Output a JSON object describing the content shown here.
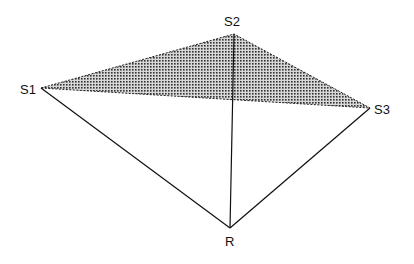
{
  "diagram": {
    "type": "geometry",
    "nodes": [
      {
        "id": "S1",
        "label": "S1",
        "x": 41,
        "y": 88,
        "label_x": 20,
        "label_y": 94
      },
      {
        "id": "S2",
        "label": "S2",
        "x": 234,
        "y": 34,
        "label_x": 224,
        "label_y": 26
      },
      {
        "id": "S3",
        "label": "S3",
        "x": 370,
        "y": 108,
        "label_x": 374,
        "label_y": 114
      },
      {
        "id": "R",
        "label": "R",
        "x": 230,
        "y": 228,
        "label_x": 225,
        "label_y": 246
      }
    ],
    "shaded_triangle": [
      "S1",
      "S2",
      "S3"
    ],
    "solid_edges": [
      [
        "S1",
        "R"
      ],
      [
        "S2",
        "R"
      ],
      [
        "S3",
        "R"
      ]
    ],
    "dashed_edges": [
      [
        "S1",
        "S2"
      ],
      [
        "S2",
        "S3"
      ],
      [
        "S1",
        "S3"
      ]
    ]
  }
}
